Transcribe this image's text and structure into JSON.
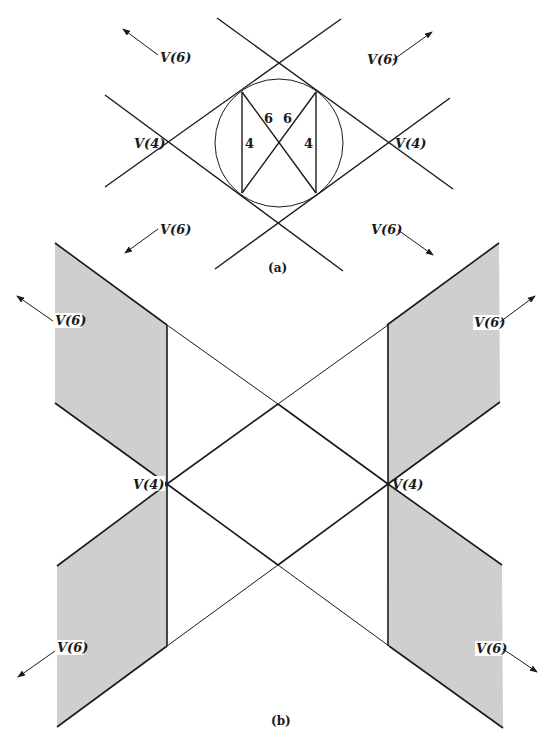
{
  "figure_a": {
    "caption": "(a)",
    "vertex_labels": {
      "left": "V(4)",
      "right": "V(4)"
    },
    "region_labels": {
      "top_left": "V(6)",
      "top_right": "V(6)",
      "bottom_left": "V(6)",
      "bottom_right": "V(6)"
    },
    "inner_labels": {
      "left_edge": "4",
      "right_edge": "4",
      "diag_left": "6",
      "diag_right": "6"
    }
  },
  "figure_b": {
    "caption": "(b)",
    "vertex_labels": {
      "left": "V(4)",
      "right": "V(4)"
    },
    "region_labels": {
      "top_left": "V(6)",
      "top_right": "V(6)",
      "bottom_left": "V(6)",
      "bottom_right": "V(6)"
    }
  },
  "colors": {
    "line": "#1a1a1a",
    "shade": "#cfcfcf",
    "background": "#ffffff"
  }
}
